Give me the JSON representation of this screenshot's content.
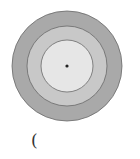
{
  "diagram": {
    "type": "concentric-circles",
    "center": [
      67,
      66
    ],
    "rings": [
      {
        "name": "outer",
        "radius": 55,
        "fill": "#a9a9a9"
      },
      {
        "name": "middle",
        "radius": 40,
        "fill": "#c8c8c8"
      },
      {
        "name": "inner",
        "radius": 26,
        "fill": "#e6e6e6"
      }
    ],
    "stroke": "#6a6a6a",
    "center_dot": {
      "radius": 1.6,
      "fill": "#222222"
    }
  },
  "caption": {
    "text": "("
  }
}
